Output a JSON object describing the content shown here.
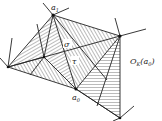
{
  "diagram": {
    "labels": {
      "a1": "a",
      "a1_sub": "1",
      "a0": "a",
      "a0_sub": "0",
      "sigma": "σ",
      "tau": "τ",
      "neighborhood": "O",
      "neighborhood_sub": "K",
      "neighborhood_arg": "(a",
      "neighborhood_arg_sub": "0",
      "neighborhood_close": ")"
    },
    "colors": {
      "line": "#222222",
      "hatch": "#555555",
      "background": "#ffffff"
    }
  }
}
